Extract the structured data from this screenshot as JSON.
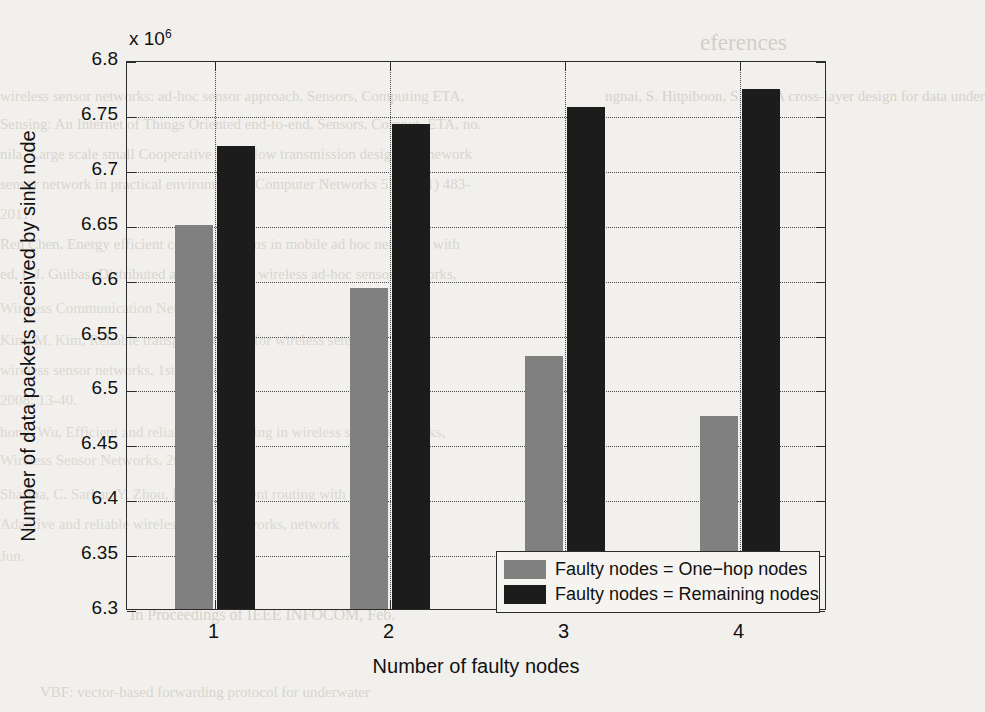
{
  "chart_data": {
    "type": "bar",
    "title": "",
    "xlabel": "Number of faulty nodes",
    "ylabel": "Number of data packets received by sink node",
    "exponent_label": "x 10",
    "exponent_power": "6",
    "categories": [
      "1",
      "2",
      "3",
      "4"
    ],
    "series": [
      {
        "name": "Faulty nodes = One−hop nodes",
        "color": "#808080",
        "values": [
          6650000,
          6592000,
          6530000,
          6476000
        ],
        "scaled_values": [
          6.65,
          6.592,
          6.53,
          6.476
        ]
      },
      {
        "name": "Faulty nodes = Remaining nodes",
        "color": "#1c1c1c",
        "values": [
          6722000,
          6742000,
          6757000,
          6774000
        ],
        "scaled_values": [
          6.722,
          6.742,
          6.757,
          6.774
        ]
      }
    ],
    "ylim": [
      6300000,
      6800000
    ],
    "ylim_scaled": [
      6.3,
      6.8
    ],
    "ytick_labels": [
      "6.3",
      "6.35",
      "6.4",
      "6.45",
      "6.5",
      "6.55",
      "6.6",
      "6.65",
      "6.7",
      "6.75",
      "6.8"
    ],
    "ytick_values": [
      6.3,
      6.35,
      6.4,
      6.45,
      6.5,
      6.55,
      6.6,
      6.65,
      6.7,
      6.75,
      6.8
    ],
    "xtick_labels": [
      "1",
      "2",
      "3",
      "4"
    ],
    "grid": true,
    "grid_style": "dotted",
    "legend_position": "lower right"
  },
  "background_text": {
    "heading": "eferences",
    "lines": [
      "ngnai, S. Hitpiboon, S. Tan, A cross-layer design for data under",
      "wireless sensor networks: ad-hoc sensor approach, Sensors, Computing ETA,",
      "Sensing: An Internet of Things Oriented end-to-end, Sensors, Comput. ETA, no.",
      "Jun.",
      "nila, Large scale small Cooperative Data-flow transmission design, framework",
      "sensor network in practical environments, Computer Networks 55 (2011) 483-",
      "2011.",
      "Ren Chen, Energy efficient communications in mobile ad hoc networks with",
      "ed, L.J. Guibas, Distributed algorithms for wireless ad-hoc sensor networks,",
      "Wireless Communication Networks, 2002.",
      "Kim, M. Kim, Reliable transport protocol for wireless sensor",
      "wireless sensor networks, 1st edition",
      "2008: 13-40.",
      "hong, Wu, Efficient and reliable broadcasting in wireless sensor networks,",
      "Wireless Sensor Networks, 2011.",
      "Sharma, C. Sarkar, Y. Zhou, Energy efficient routing with",
      "Adaptive and reliable wireless sensor networks, network",
      "In Proceedings of IEEE INFOCOM, Feb.",
      "VBF: vector-based forwarding protocol for underwater"
    ]
  }
}
